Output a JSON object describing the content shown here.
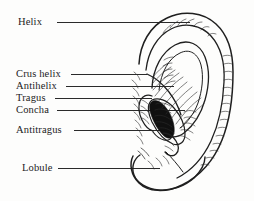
{
  "figure": {
    "background_color": "#fdfdfc",
    "ink_color": "#1c1c1c",
    "line_color": "#2a2a2a"
  },
  "labels": [
    {
      "id": "helix",
      "text": "Helix",
      "leader": {
        "x1": 57,
        "y1": 22,
        "x2": 190,
        "y2": 22
      }
    },
    {
      "id": "crus-helix",
      "text": "Crus helix",
      "leader": {
        "x1": 71,
        "y1": 74,
        "x2": 147,
        "y2": 74
      }
    },
    {
      "id": "antihelix",
      "text": "Antihelix",
      "leader": {
        "x1": 66,
        "y1": 86,
        "x2": 174,
        "y2": 86
      }
    },
    {
      "id": "tragus",
      "text": "Tragus",
      "leader": {
        "x1": 55,
        "y1": 98,
        "x2": 152,
        "y2": 98
      }
    },
    {
      "id": "concha",
      "text": "Concha",
      "leader": {
        "x1": 57,
        "y1": 110,
        "x2": 185,
        "y2": 110
      }
    },
    {
      "id": "antitragus",
      "text": "Antitragus",
      "leader": {
        "x1": 74,
        "y1": 130,
        "x2": 163,
        "y2": 130
      }
    },
    {
      "id": "lobule",
      "text": "Lobule",
      "leader": {
        "x1": 58,
        "y1": 168,
        "x2": 160,
        "y2": 168
      }
    }
  ]
}
